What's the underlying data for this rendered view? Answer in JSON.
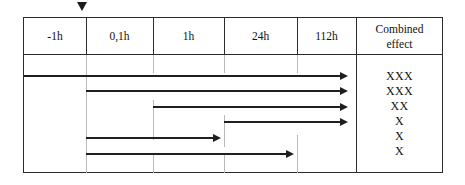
{
  "figure": {
    "type": "timeline-table",
    "marker_icon": "down-triangle-marker"
  },
  "table": {
    "columns": [
      {
        "id": "col-minus1h",
        "label": "-1h",
        "label2": ""
      },
      {
        "id": "col-01h",
        "label": "0,1h",
        "label2": ""
      },
      {
        "id": "col-1h",
        "label": "1h",
        "label2": ""
      },
      {
        "id": "col-24h",
        "label": "24h",
        "label2": ""
      },
      {
        "id": "col-112h",
        "label": "112h",
        "label2": ""
      },
      {
        "id": "col-effect",
        "label": "Combined",
        "label2": "effect"
      }
    ],
    "rows": [
      {
        "id": "row-1",
        "start_col": "-1h",
        "end_col": "112h-end",
        "effect": "XXX"
      },
      {
        "id": "row-2",
        "start_col": "0,1h",
        "end_col": "112h-end",
        "effect": "XXX"
      },
      {
        "id": "row-3",
        "start_col": "1h",
        "end_col": "112h-end",
        "effect": "XX"
      },
      {
        "id": "row-4",
        "start_col": "24h",
        "end_col": "112h-end",
        "effect": "X"
      },
      {
        "id": "row-5",
        "start_col": "0,1h",
        "end_col": "24h",
        "effect": "X"
      },
      {
        "id": "row-6",
        "start_col": "0,1h",
        "end_col": "112h",
        "effect": "X"
      }
    ],
    "effect_values": [
      "XXX",
      "XXX",
      "XX",
      "X",
      "X",
      "X"
    ]
  },
  "colors": {
    "border": "#2b2b2b",
    "arrow": "#1f1f1f",
    "tick": "#b9b9b9",
    "text": "#111111",
    "background": "#ffffff"
  }
}
